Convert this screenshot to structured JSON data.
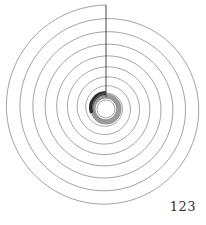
{
  "page": {
    "page_number": "123"
  },
  "diagram": {
    "type": "spiral",
    "turns": 9,
    "colors": {
      "line": "#8a8a8a",
      "radius_line": "#333333",
      "dark_band": "#2b2b2b",
      "gray_band": "#9a9a9a",
      "background": "#ffffff"
    }
  }
}
